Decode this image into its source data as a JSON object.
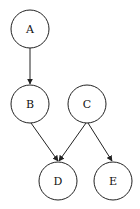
{
  "diagram": {
    "type": "directed-graph",
    "nodes": [
      {
        "id": "A",
        "label": "A",
        "cx": 30,
        "cy": 29
      },
      {
        "id": "B",
        "label": "B",
        "cx": 30,
        "cy": 104
      },
      {
        "id": "C",
        "label": "C",
        "cx": 87,
        "cy": 104
      },
      {
        "id": "D",
        "label": "D",
        "cx": 58,
        "cy": 181
      },
      {
        "id": "E",
        "label": "E",
        "cx": 113,
        "cy": 181
      }
    ],
    "edges": [
      {
        "from": "A",
        "to": "B"
      },
      {
        "from": "B",
        "to": "D"
      },
      {
        "from": "C",
        "to": "D"
      },
      {
        "from": "C",
        "to": "E"
      }
    ],
    "colors": {
      "stroke": "#222222",
      "background": "#ffffff"
    }
  }
}
